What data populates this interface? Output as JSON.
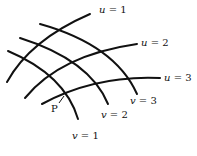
{
  "diagram": {
    "type": "curvilinear-coordinate-grid",
    "u_curves": [
      {
        "label_var": "u",
        "label_eq": " = 1",
        "value": 1
      },
      {
        "label_var": "u",
        "label_eq": " = 2",
        "value": 2
      },
      {
        "label_var": "u",
        "label_eq": " = 3",
        "value": 3
      }
    ],
    "v_curves": [
      {
        "label_var": "v",
        "label_eq": " = 1",
        "value": 1
      },
      {
        "label_var": "v",
        "label_eq": " = 2",
        "value": 2
      },
      {
        "label_var": "v",
        "label_eq": " = 3",
        "value": 3
      }
    ],
    "point": {
      "label": "P"
    },
    "colors": {
      "stroke": "#111111",
      "background": "#ffffff"
    }
  }
}
